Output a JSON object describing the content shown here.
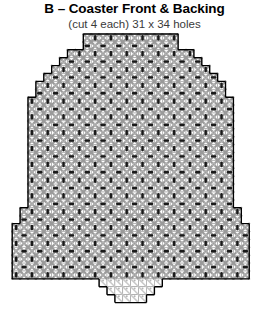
{
  "header": {
    "title": "B – Coaster Front & Backing",
    "subtitle": "(cut 4 each) 31 x 34 holes"
  },
  "chart_data": {
    "type": "heatmap",
    "title": "B – Coaster Front & Backing",
    "subtitle": "(cut 4 each) 31 x 34 holes",
    "xlabel": "",
    "ylabel": "",
    "grid": true,
    "legend_position": "none",
    "cols": 31,
    "rows": 34,
    "cut_count": 4,
    "shape": "bell",
    "cell_px": 7.9,
    "colors": {
      "grid_line": "#8d8d8d",
      "outline": "#000000",
      "diagonal_stitch": "#9a9a9a",
      "bar_stitch": "#1a1a1a",
      "dot_stitch": "#b5b5b5",
      "background": "#ffffff"
    },
    "row_extents": [
      {
        "row": 0,
        "start": 9,
        "end": 21
      },
      {
        "row": 1,
        "start": 9,
        "end": 21
      },
      {
        "row": 2,
        "start": 7,
        "end": 23
      },
      {
        "row": 3,
        "start": 6,
        "end": 24
      },
      {
        "row": 4,
        "start": 5,
        "end": 25
      },
      {
        "row": 5,
        "start": 4,
        "end": 26
      },
      {
        "row": 6,
        "start": 3,
        "end": 27
      },
      {
        "row": 7,
        "start": 3,
        "end": 27
      },
      {
        "row": 8,
        "start": 2,
        "end": 28
      },
      {
        "row": 9,
        "start": 2,
        "end": 28
      },
      {
        "row": 10,
        "start": 2,
        "end": 28
      },
      {
        "row": 11,
        "start": 2,
        "end": 28
      },
      {
        "row": 12,
        "start": 2,
        "end": 28
      },
      {
        "row": 13,
        "start": 2,
        "end": 28
      },
      {
        "row": 14,
        "start": 2,
        "end": 28
      },
      {
        "row": 15,
        "start": 2,
        "end": 28
      },
      {
        "row": 16,
        "start": 2,
        "end": 28
      },
      {
        "row": 17,
        "start": 2,
        "end": 28
      },
      {
        "row": 18,
        "start": 2,
        "end": 28
      },
      {
        "row": 19,
        "start": 2,
        "end": 28
      },
      {
        "row": 20,
        "start": 2,
        "end": 28
      },
      {
        "row": 21,
        "start": 2,
        "end": 28
      },
      {
        "row": 22,
        "start": 1,
        "end": 29
      },
      {
        "row": 23,
        "start": 1,
        "end": 29
      },
      {
        "row": 24,
        "start": 0,
        "end": 30
      },
      {
        "row": 25,
        "start": 0,
        "end": 30
      },
      {
        "row": 26,
        "start": 0,
        "end": 30
      },
      {
        "row": 27,
        "start": 0,
        "end": 30
      },
      {
        "row": 28,
        "start": 0,
        "end": 30
      },
      {
        "row": 29,
        "start": 0,
        "end": 30
      },
      {
        "row": 30,
        "start": 0,
        "end": 30
      },
      {
        "row": 31,
        "start": 11,
        "end": 19
      },
      {
        "row": 32,
        "start": 12,
        "end": 18
      },
      {
        "row": 33,
        "start": 13,
        "end": 17
      }
    ],
    "stitch_legend": [
      {
        "symbol": "diagonal-cross",
        "name": "Cross / X stitch",
        "color": "#9a9a9a"
      },
      {
        "symbol": "vertical-bar",
        "name": "Upright bar stitch",
        "color": "#1a1a1a"
      },
      {
        "symbol": "horizontal-bar",
        "name": "Flat bar stitch",
        "color": "#1a1a1a"
      },
      {
        "symbol": "dot",
        "name": "French knot / dot",
        "color": "#b5b5b5"
      }
    ],
    "motif": {
      "period_cols": 2,
      "period_rows": 2,
      "description": "Alternating checkerboard of upright and flat bar stitches inside gray cross-stitch diamonds, with small dots at diamond junctions."
    }
  }
}
